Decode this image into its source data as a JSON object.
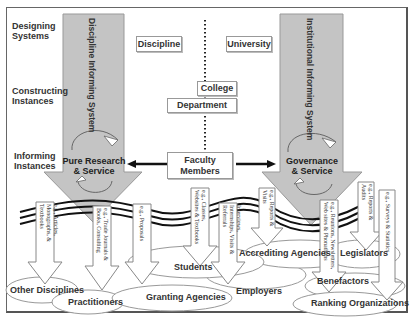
{
  "row_labels": {
    "designing": [
      "Designing",
      "Systems"
    ],
    "constructing": [
      "Constructing",
      "Instances"
    ],
    "informing": [
      "Informing",
      "Instances"
    ]
  },
  "big_arrows": {
    "left": {
      "title": "Discipline Informing System",
      "center": [
        "Pure Research",
        "& Service"
      ]
    },
    "right": {
      "title": "Institutional Informing System",
      "center": [
        "Governance",
        "& Service"
      ]
    }
  },
  "hierarchy": {
    "discipline": "Discipline",
    "university": "University",
    "college": "College",
    "department": "Department",
    "faculty": [
      "Faculty",
      "Members"
    ]
  },
  "channels": [
    "e.g., Articles, Monographs, & Textbooks",
    "e.g., Trade Journals & Books, Consulting",
    "e.g., Proposals",
    "e.g., Classes, Websites & Textbooks",
    "Interviews, Internships, Visits & Referrals",
    "e.g., Reports & Visits",
    "e.g., Reunions, Newsletters, Web sites & Phonathons",
    "e.g., Reports & Audits",
    "e.g., Surveys & Statistics"
  ],
  "audiences": {
    "other_disciplines": "Other Disciplines",
    "practitioners": "Practitioners",
    "granting_agencies": "Granting Agencies",
    "students": "Students",
    "employers": "Employers",
    "accrediting_agencies": "Accrediting Agencies",
    "legislators": "Legislators",
    "benefactors": "Benefactors",
    "ranking_organizations": "Ranking Organizations"
  },
  "colors": {
    "arrow_fill": "#c4c4c4",
    "arrow_stroke": "#999999",
    "line": "#111111"
  }
}
